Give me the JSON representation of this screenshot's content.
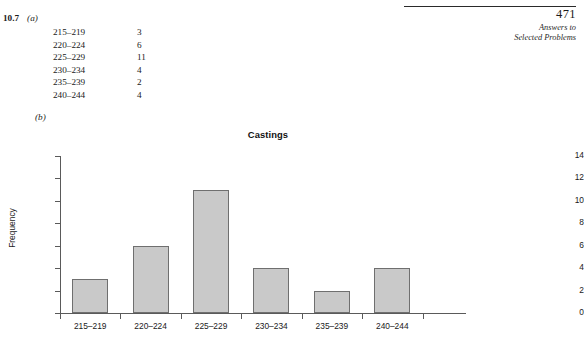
{
  "page_header": {
    "folio": "471",
    "running_head_line1": "Answers to",
    "running_head_line2": "Selected Problems"
  },
  "problem": {
    "number": "10.7",
    "part_a_label": "(a)",
    "part_b_label": "(b)",
    "table": {
      "rows": [
        {
          "class_interval": "215–219",
          "frequency": "3"
        },
        {
          "class_interval": "220–224",
          "frequency": "6"
        },
        {
          "class_interval": "225–229",
          "frequency": "11"
        },
        {
          "class_interval": "230–234",
          "frequency": "4"
        },
        {
          "class_interval": "235–239",
          "frequency": "2"
        },
        {
          "class_interval": "240–244",
          "frequency": "4"
        }
      ]
    }
  },
  "chart_data": {
    "type": "bar",
    "title": "Castings",
    "xlabel": "",
    "ylabel": "Frequency",
    "categories": [
      "215–219",
      "220–224",
      "225–229",
      "230–234",
      "235–239",
      "240–244"
    ],
    "values": [
      3,
      6,
      11,
      4,
      2,
      4
    ],
    "ylim": [
      0,
      14
    ],
    "ytick_labels": [
      "0",
      "2",
      "4",
      "6",
      "8",
      "10",
      "12",
      "14"
    ],
    "ytick_values": [
      0,
      2,
      4,
      6,
      8,
      10,
      12,
      14
    ],
    "grid": false,
    "legend": false,
    "bar_fill_color": "#c9c9c9",
    "bar_edge_color": "#6f6f6f",
    "axis_color": "#5a5a5a"
  }
}
